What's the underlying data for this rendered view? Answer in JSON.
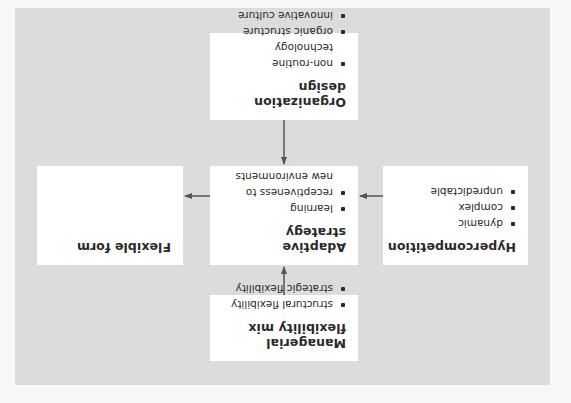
{
  "diagram": {
    "orientation": "rotated 180 degrees",
    "colors": {
      "panel_background": "#dcdcdc",
      "box_background": "#ffffff",
      "arrow": "#555555",
      "text": "#2a2a2a"
    },
    "nodes": {
      "managerial": {
        "title": "Managerial flexibility mix",
        "items": [
          "structural flexibility",
          "strategic flexibility"
        ]
      },
      "hypercompetition": {
        "title": "Hypercompetition",
        "items": [
          "dynamic",
          "complex",
          "unpredictable"
        ]
      },
      "adaptive": {
        "title": "Adaptive strategy",
        "items": [
          "learning",
          "receptiveness to new environments"
        ]
      },
      "flexible": {
        "title": "Flexible form",
        "items": []
      },
      "organization": {
        "title": "Organization design",
        "items": [
          "non-routine technology",
          "organic structure",
          "innovative culture"
        ]
      }
    },
    "edges": [
      {
        "from": "Managerial flexibility mix",
        "to": "Adaptive strategy"
      },
      {
        "from": "Hypercompetition",
        "to": "Adaptive strategy"
      },
      {
        "from": "Organization design",
        "to": "Adaptive strategy"
      },
      {
        "from": "Adaptive strategy",
        "to": "Flexible form"
      }
    ]
  }
}
